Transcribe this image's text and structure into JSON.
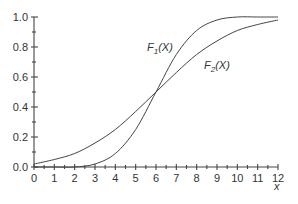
{
  "chart_data": {
    "type": "line",
    "title": "",
    "xlabel": "x",
    "ylabel": "",
    "xlim": [
      0,
      12
    ],
    "ylim": [
      0,
      1.0
    ],
    "x_ticks": [
      "0",
      "1",
      "2",
      "3",
      "4",
      "5",
      "6",
      "7",
      "8",
      "9",
      "10",
      "11",
      "12"
    ],
    "y_ticks": [
      "0.0",
      "0.2",
      "0.4",
      "0.6",
      "0.8",
      "1.0"
    ],
    "grid": false,
    "legend": "inline labels",
    "series": [
      {
        "name": "F1(X)",
        "description": "Steeper CDF, centered at x≈6 (normal, sd≈1.5)",
        "x": [
          0,
          1,
          2,
          3,
          4,
          5,
          6,
          7,
          8,
          9,
          10,
          11,
          12
        ],
        "values": [
          0.0,
          0.0,
          0.0,
          0.02,
          0.09,
          0.25,
          0.5,
          0.75,
          0.91,
          0.98,
          1.0,
          1.0,
          1.0
        ]
      },
      {
        "name": "F2(X)",
        "description": "Flatter CDF, centered at x≈6 (normal, sd≈3)",
        "x": [
          0,
          1,
          2,
          3,
          4,
          5,
          6,
          7,
          8,
          9,
          10,
          11,
          12
        ],
        "values": [
          0.02,
          0.05,
          0.09,
          0.16,
          0.25,
          0.37,
          0.5,
          0.63,
          0.75,
          0.84,
          0.91,
          0.95,
          0.98
        ]
      }
    ],
    "annotations": [
      {
        "text": "F1(X)",
        "x": 5.8,
        "y": 0.8
      },
      {
        "text": "F2(X)",
        "x": 8.5,
        "y": 0.68
      }
    ]
  },
  "labels": {
    "f1_main": "F",
    "f1_sub": "1",
    "f1_arg": "(X)",
    "f2_main": "F",
    "f2_sub": "2",
    "f2_arg": "(X)",
    "x_axis": "x"
  }
}
